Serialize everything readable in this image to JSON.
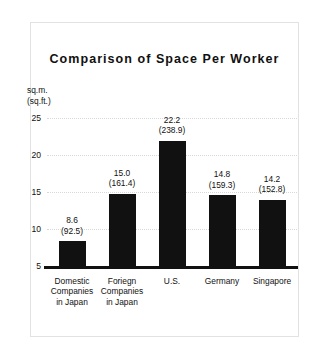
{
  "chart_data": {
    "type": "bar",
    "title": "Comparison of Space Per Worker",
    "xlabel": "",
    "ylabel": "sq.m.",
    "ylabel_secondary": "(sq.ft.)",
    "ylim": [
      5,
      25
    ],
    "yticks": [
      "25",
      "20",
      "15",
      "10",
      "5"
    ],
    "grid": true,
    "legend": "none",
    "unit_primary": "sq.m.",
    "unit_secondary": "(sq.ft.)",
    "categories": [
      "Domestic Companies in Japan",
      "Foriegn Companies in Japan",
      "U.S.",
      "Germany",
      "Singapore"
    ],
    "category_lines": [
      [
        "Domestic",
        "Companies",
        "in Japan"
      ],
      [
        "Foriegn",
        "Companies",
        "in Japan"
      ],
      [
        "U.S."
      ],
      [
        "Germany"
      ],
      [
        "Singapore"
      ]
    ],
    "values": [
      8.6,
      15.0,
      22.2,
      14.8,
      14.2
    ],
    "values_sqft": [
      92.5,
      161.4,
      238.9,
      159.3,
      152.8
    ],
    "value_labels": [
      "8.6",
      "15.0",
      "22.2",
      "14.8",
      "14.2"
    ],
    "value_labels_sqft": [
      "(92.5)",
      "(161.4)",
      "(238.9)",
      "(159.3)",
      "(152.8)"
    ],
    "bar_color": "#111111",
    "grid_color": "#d8d8d8",
    "axis_color": "#111111",
    "background": "#ffffff"
  }
}
